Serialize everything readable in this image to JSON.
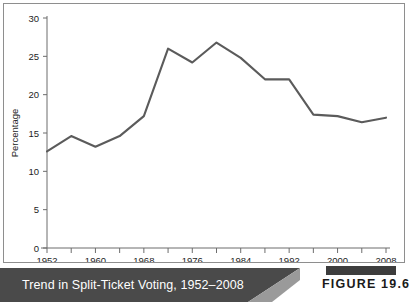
{
  "figure": {
    "caption": "Trend in Split-Ticket Voting, 1952–2008",
    "number_label": "FIGURE 19.6",
    "banner_color": "#4a4a4a",
    "banner_accent_color": "#9a9a9a",
    "bar_color": "#3d3d3d",
    "caption_text_color": "#ffffff"
  },
  "chart_data": {
    "type": "line",
    "title": "Trend in Split-Ticket Voting, 1952–2008",
    "xlabel": "",
    "ylabel": "Percentage",
    "xlim": [
      1952,
      2008
    ],
    "ylim": [
      0,
      30
    ],
    "ytick_labels": [
      "0",
      "5",
      "10",
      "15",
      "20",
      "25",
      "30"
    ],
    "yticks": [
      0,
      5,
      10,
      15,
      20,
      25,
      30
    ],
    "xtick_labels": [
      "1952",
      "1960",
      "1968",
      "1976",
      "1984",
      "1992",
      "2000",
      "2008"
    ],
    "xticks_major": [
      1952,
      1960,
      1968,
      1976,
      1984,
      1992,
      2000,
      2008
    ],
    "xticks_minor": [
      1956,
      1964,
      1972,
      1980,
      1988,
      1996,
      2004
    ],
    "grid": false,
    "legend": null,
    "line_color": "#5b5b5b",
    "axis_color": "#6d6d6d",
    "x": [
      1952,
      1956,
      1960,
      1964,
      1968,
      1972,
      1976,
      1980,
      1984,
      1988,
      1992,
      1996,
      2000,
      2004,
      2008
    ],
    "values": [
      12.6,
      14.6,
      13.2,
      14.6,
      17.2,
      26.0,
      24.2,
      26.8,
      24.8,
      22.0,
      22.0,
      17.4,
      17.2,
      16.4,
      17.0
    ],
    "series": [
      {
        "name": "Split-ticket voting",
        "values": [
          12.6,
          14.6,
          13.2,
          14.6,
          17.2,
          26.0,
          24.2,
          26.8,
          24.8,
          22.0,
          22.0,
          17.4,
          17.2,
          16.4,
          17.0
        ]
      }
    ]
  }
}
